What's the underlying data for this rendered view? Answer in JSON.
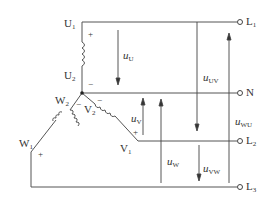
{
  "diagram": {
    "type": "three-phase star (Y) connection with neutral",
    "terminals": [
      {
        "id": "L1",
        "label": "L",
        "sub": "1"
      },
      {
        "id": "N",
        "label": "N",
        "sub": ""
      },
      {
        "id": "L2",
        "label": "L",
        "sub": "2"
      },
      {
        "id": "L3",
        "label": "L",
        "sub": "3"
      }
    ],
    "windings": {
      "U1": {
        "label": "U",
        "sub": "1"
      },
      "U2": {
        "label": "U",
        "sub": "2"
      },
      "V1": {
        "label": "V",
        "sub": "1"
      },
      "V2": {
        "label": "V",
        "sub": "2"
      },
      "W1": {
        "label": "W",
        "sub": "1"
      },
      "W2": {
        "label": "W",
        "sub": "2"
      }
    },
    "voltages": {
      "uU": {
        "label": "u",
        "sub": "U"
      },
      "uV": {
        "label": "u",
        "sub": "V"
      },
      "uW": {
        "label": "u",
        "sub": "W"
      },
      "uUV": {
        "label": "u",
        "sub": "UV"
      },
      "uVW": {
        "label": "u",
        "sub": "VW"
      },
      "uWU": {
        "label": "u",
        "sub": "WU"
      }
    },
    "signs": {
      "plus": "+",
      "minus": "−"
    },
    "colors": {
      "line": "#444444",
      "text": "#333333"
    }
  }
}
